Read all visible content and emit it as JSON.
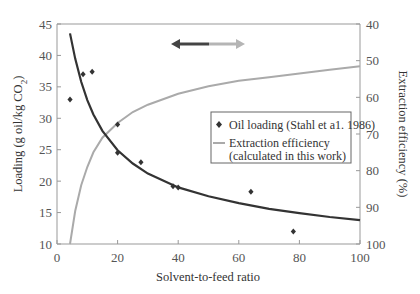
{
  "chart_data": {
    "type": "line",
    "title": "",
    "xlabel": "Solvent-to-feed ratio",
    "ylabel": "Loading (g oil/kg CO2)",
    "ylabel_right": "Extraction efficiency (%)",
    "xlim": [
      0,
      100
    ],
    "ylim": [
      10,
      45
    ],
    "ylim_right": [
      40,
      100
    ],
    "right_axis_inverted": true,
    "x_ticks": [
      "0",
      "20",
      "40",
      "60",
      "80",
      "100"
    ],
    "y_ticks": [
      "10",
      "15",
      "20",
      "25",
      "30",
      "35",
      "40",
      "45"
    ],
    "y_ticks_right": [
      "40",
      "50",
      "60",
      "70",
      "80",
      "90",
      "100"
    ],
    "grid": false,
    "legend_position": "center-right",
    "series": [
      {
        "name": "Oil loading (Stahl et al. 1986)",
        "kind": "scatter",
        "marker": "diamond",
        "color": "#333333",
        "axis": "left",
        "x": [
          4.3,
          8.6,
          11.6,
          20,
          20,
          27.7,
          38.3,
          40,
          64,
          78
        ],
        "values": [
          33.0,
          37.0,
          37.4,
          29.0,
          24.5,
          23.0,
          19.2,
          19.0,
          18.3,
          12.0
        ]
      },
      {
        "name": "Oil loading fit",
        "kind": "line",
        "color": "#333333",
        "axis": "left",
        "x": [
          4.3,
          6,
          8,
          10,
          12,
          15,
          20,
          25,
          30,
          40,
          50,
          60,
          70,
          80,
          90,
          100
        ],
        "values": [
          43.5,
          39.5,
          35.8,
          32.9,
          30.6,
          28.0,
          24.9,
          22.8,
          21.2,
          19.0,
          17.6,
          16.5,
          15.6,
          14.9,
          14.3,
          13.8
        ]
      },
      {
        "name": "Extraction efficiency (calculated in this work)",
        "kind": "line",
        "color": "#aaaaaa",
        "axis": "right",
        "x": [
          4.3,
          6,
          8,
          10,
          12,
          15,
          20,
          25,
          30,
          40,
          50,
          60,
          70,
          80,
          90,
          100
        ],
        "values": [
          100,
          91,
          84,
          79,
          75,
          71,
          67,
          64,
          62,
          59,
          57,
          55.5,
          54.5,
          53.5,
          52.5,
          51.5
        ]
      }
    ],
    "annotations": [
      {
        "type": "double-arrow",
        "left_color": "#444444",
        "right_color": "#aaaaaa",
        "position": "top-center"
      }
    ]
  },
  "legend": {
    "items": [
      {
        "label": "Oil loading (Stahl et a1. 1986)",
        "symbol": "diamond"
      },
      {
        "label_line1": "Extraction efficiency",
        "label_line2": "(calculated in this work)",
        "symbol": "line"
      }
    ]
  },
  "axes": {
    "x_title": "Solvent-to-feed ratio",
    "y_left_title_main": "Loading (g oil/kg CO",
    "y_left_title_sub": "2",
    "y_left_title_end": ")",
    "y_right_title": "Extraction efficiency (%)"
  }
}
